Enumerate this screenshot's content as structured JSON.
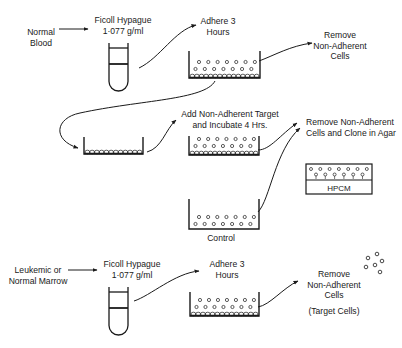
{
  "diagram": {
    "colors": {
      "ink": "#1a1a1a",
      "background": "#ffffff"
    },
    "labels": {
      "normal_blood": "Normal\nBlood",
      "ficoll_top": "Ficoll Hypague\n1·077 g/ml",
      "adhere_top": "Adhere 3\nHours",
      "remove_top": "Remove\nNon-Adherent\nCells",
      "add_target": "Add Non-Adherent Target\nand Incubate 4 Hrs.",
      "remove_clone": "Remove Non-Adherent\nCells and Clone in Agar",
      "hpcm": "HPCM",
      "control": "Control",
      "leukemic_marrow": "Leukemic or\nNormal Marrow",
      "ficoll_bottom": "Ficoll Hypague\n1·077 g/ml",
      "adhere_bottom": "Adhere 3\nHours",
      "remove_bottom": "Remove\nNon-Adherent\nCells",
      "target_cells": "(Target Cells)"
    },
    "steps": [
      {
        "id": "normal-blood",
        "kind": "source"
      },
      {
        "id": "ficoll-tube-top",
        "kind": "tube"
      },
      {
        "id": "adhere-dish-top",
        "kind": "dish",
        "free_cell_rows": 2,
        "adherent_layer": true
      },
      {
        "id": "adherent-dish",
        "kind": "dish",
        "free_cell_rows": 0,
        "adherent_layer": true
      },
      {
        "id": "incubate-dish",
        "kind": "dish",
        "free_cell_rows": 2,
        "adherent_layer": true
      },
      {
        "id": "control-dish",
        "kind": "dish",
        "free_cell_rows": 2,
        "adherent_layer": false
      },
      {
        "id": "agar-plate",
        "kind": "agar",
        "medium": "HPCM"
      },
      {
        "id": "leukemic-marrow",
        "kind": "source"
      },
      {
        "id": "ficoll-tube-bottom",
        "kind": "tube"
      },
      {
        "id": "adhere-dish-bottom",
        "kind": "dish",
        "free_cell_rows": 2,
        "adherent_layer": true
      },
      {
        "id": "target-cells",
        "kind": "cells"
      }
    ]
  }
}
